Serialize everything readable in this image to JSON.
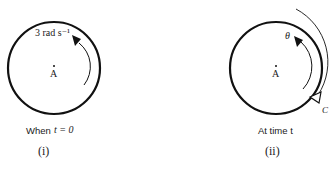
{
  "figure_i": {
    "angular_velocity_label": "3 rad s⁻¹",
    "center_label": "A",
    "caption_prefix": "When",
    "caption_condition": "t = 0",
    "panel_label": "(i)"
  },
  "figure_ii": {
    "angle_label": "θ",
    "center_label": "A",
    "arc_label": "C",
    "caption": "At time t",
    "panel_label": "(ii)"
  },
  "colors": {
    "stroke": "#111111",
    "background": "#ffffff"
  }
}
